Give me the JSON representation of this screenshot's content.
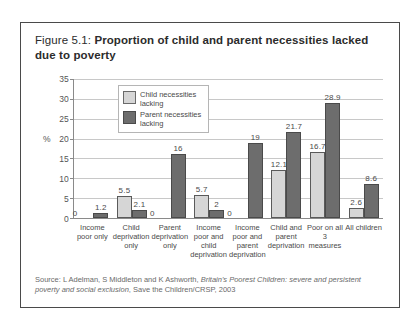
{
  "figure": {
    "number": "Figure 5.1:",
    "title": "Proportion of child and parent necessities lacked due to poverty"
  },
  "source": {
    "prefix": "Source: L Adelman, S Middleton and K Ashworth, ",
    "italic": "Britain's Poorest Children: severe and persistent poverty and social exclusion",
    "suffix": ", Save the Children/CRSP, 2003"
  },
  "axis": {
    "unit": "%",
    "ticks": [
      "35",
      "30",
      "25",
      "20",
      "15",
      "10",
      "5",
      "0"
    ]
  },
  "legend": {
    "items": [
      {
        "label": "Child necessities lacking",
        "color": "#d6d6d6",
        "key": "child"
      },
      {
        "label": "Parent necessities lacking",
        "color": "#6d6d6d",
        "key": "parent"
      }
    ]
  },
  "chart_data": {
    "type": "bar",
    "title": "Proportion of child and parent necessities lacked due to poverty",
    "xlabel": "",
    "ylabel": "%",
    "ylim": [
      0,
      35
    ],
    "ytick_step": 5,
    "grid": true,
    "legend_position": "top-left inside plot",
    "categories": [
      "Income poor only",
      "Child deprivation only",
      "Parent deprivation only",
      "Income poor and child deprivation",
      "Income poor and parent deprivation",
      "Child and parent deprivation",
      "Poor on all 3 measures",
      "All children"
    ],
    "series": [
      {
        "name": "Child necessities lacking",
        "color": "#d6d6d6",
        "values": [
          0,
          5.5,
          0,
          5.7,
          0,
          12.1,
          16.7,
          2.6
        ],
        "labels": [
          "0",
          "5.5",
          "0",
          "5.7",
          "0",
          "12.1",
          "16.7",
          "2.6"
        ]
      },
      {
        "name": "Parent necessities lacking",
        "color": "#6d6d6d",
        "values": [
          1.2,
          2.1,
          16,
          2,
          19,
          21.7,
          28.9,
          8.6
        ],
        "labels": [
          "1.2",
          "2.1",
          "16",
          "2",
          "19",
          "21.7",
          "28.9",
          "8.6"
        ]
      }
    ]
  }
}
